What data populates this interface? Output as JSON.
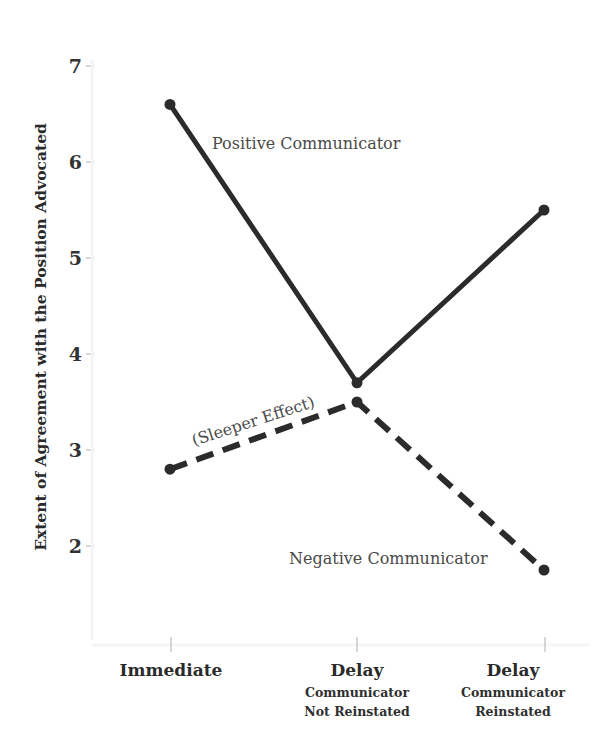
{
  "chart_data": {
    "type": "line",
    "title": "",
    "xlabel": "",
    "ylabel": "Extent of Agreement with the Position Advocated",
    "ylim": [
      1,
      7.3
    ],
    "yticks": [
      2,
      3,
      4,
      5,
      6,
      7
    ],
    "grid": false,
    "legend": "none (lines labeled inline)",
    "categories": [
      {
        "main": "Immediate",
        "sub": []
      },
      {
        "main": "Delay",
        "sub": [
          "Communicator",
          "Not Reinstated"
        ]
      },
      {
        "main": "Delay",
        "sub": [
          "Communicator",
          "Reinstated"
        ]
      }
    ],
    "series": [
      {
        "name": "Positive Communicator",
        "style": "solid",
        "values": [
          6.6,
          3.7,
          5.5
        ]
      },
      {
        "name": "Negative Communicator",
        "style": "dashed",
        "values": [
          2.8,
          3.5,
          1.75
        ]
      }
    ],
    "annotations": [
      {
        "text": "Positive Communicator",
        "near": "positive series, between Immediate and Delay"
      },
      {
        "text": "(Sleeper Effect)",
        "near": "negative series rising segment"
      },
      {
        "text": "Negative Communicator",
        "near": "negative series, lower right"
      }
    ]
  },
  "labels": {
    "ylabel": "Extent of Agreement with the Position Advocated",
    "yticks": [
      "7",
      "6",
      "5",
      "4",
      "3",
      "2"
    ],
    "x": {
      "c0_main": "Immediate",
      "c1_main": "Delay",
      "c1_sub1": "Communicator",
      "c1_sub2": "Not Reinstated",
      "c2_main": "Delay",
      "c2_sub1": "Communicator",
      "c2_sub2": "Reinstated"
    },
    "positive": "Positive Communicator",
    "negative": "Negative Communicator",
    "sleeper": "(Sleeper Effect)"
  },
  "colors": {
    "line": "#2b2b2b",
    "tick": "#bdbdbd",
    "annotation_text": "#4a4a4a"
  }
}
